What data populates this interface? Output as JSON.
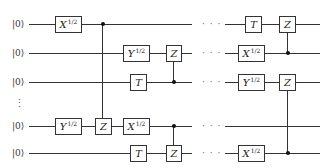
{
  "diagram": {
    "type": "quantum-circuit",
    "qubits": [
      {
        "label": "|0⟩",
        "y": 24
      },
      {
        "label": "|0⟩",
        "y": 53
      },
      {
        "label": "|0⟩",
        "y": 82
      },
      {
        "label": "|0⟩",
        "y": 126
      },
      {
        "label": "|0⟩",
        "y": 153
      }
    ],
    "vertical_ellipsis": "⋮",
    "horizontal_ellipsis": "· · ·",
    "gates": [
      {
        "qubit": 0,
        "name": "X",
        "power": "1/2",
        "x": 55,
        "w": 27
      },
      {
        "qubit": 1,
        "name": "Y",
        "power": "1/2",
        "x": 123,
        "w": 27
      },
      {
        "qubit": 1,
        "name": "Z",
        "power": "",
        "x": 166,
        "w": 16
      },
      {
        "qubit": 2,
        "name": "T",
        "power": "",
        "x": 130,
        "w": 17
      },
      {
        "qubit": 3,
        "name": "Y",
        "power": "1/2",
        "x": 55,
        "w": 27
      },
      {
        "qubit": 3,
        "name": "Z",
        "power": "",
        "x": 95,
        "w": 17
      },
      {
        "qubit": 3,
        "name": "X",
        "power": "1/2",
        "x": 123,
        "w": 27
      },
      {
        "qubit": 4,
        "name": "T",
        "power": "",
        "x": 130,
        "w": 17
      },
      {
        "qubit": 4,
        "name": "Z",
        "power": "",
        "x": 166,
        "w": 16
      },
      {
        "qubit": 0,
        "name": "T",
        "power": "",
        "x": 245,
        "w": 17
      },
      {
        "qubit": 0,
        "name": "Z",
        "power": "",
        "x": 279,
        "w": 17
      },
      {
        "qubit": 1,
        "name": "X",
        "power": "1/2",
        "x": 238,
        "w": 27
      },
      {
        "qubit": 2,
        "name": "Y",
        "power": "1/2",
        "x": 238,
        "w": 27
      },
      {
        "qubit": 2,
        "name": "Z",
        "power": "",
        "x": 279,
        "w": 17
      },
      {
        "qubit": 4,
        "name": "X",
        "power": "1/2",
        "x": 238,
        "w": 27
      }
    ],
    "controlled_z": [
      {
        "control": 0,
        "target": 3,
        "x": 103
      },
      {
        "control": 2,
        "target": 1,
        "x": 174
      },
      {
        "control": 3,
        "target": 4,
        "x": 174
      },
      {
        "control": 1,
        "target": 0,
        "x": 287
      },
      {
        "control": 4,
        "target": 2,
        "x": 287
      }
    ]
  }
}
